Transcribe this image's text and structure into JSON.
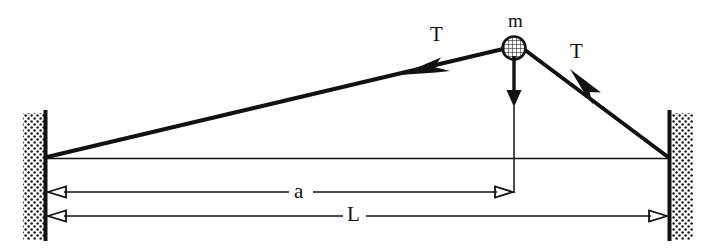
{
  "figure": {
    "background_color": "#ffffff",
    "ink_color": "#111111",
    "labels": {
      "mass": "m",
      "tension_left": "T",
      "tension_right": "T",
      "distance_a": "a",
      "distance_L": "L"
    },
    "elements": {
      "left_wall_name": "left-wall",
      "right_wall_name": "right-wall",
      "mass_name": "mass-bob",
      "weight_arrow_name": "weight-arrow",
      "string_left_name": "string-left-segment",
      "string_right_name": "string-right-segment",
      "reference_line_name": "horizontal-reference-line",
      "drop_line_name": "mass-drop-line"
    },
    "geometry": {
      "left_anchor": {
        "x": 47,
        "y": 157
      },
      "right_anchor": {
        "x": 668,
        "y": 157
      },
      "mass_center": {
        "x": 514,
        "y": 48
      },
      "mass_radius": 11,
      "weight_arrow_tip": {
        "x": 514,
        "y": 106
      },
      "dim_a_y": 192,
      "dim_L_y": 216,
      "dim_a_right_x": 514,
      "wall_top": 113,
      "wall_bottom": 240
    }
  }
}
